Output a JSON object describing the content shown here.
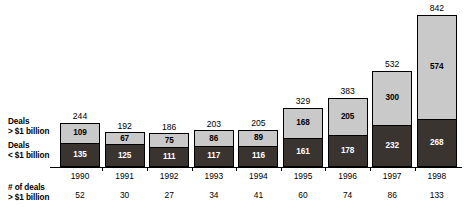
{
  "legend": {
    "above": {
      "line1": "Deals",
      "line2": "> $1 billion"
    },
    "below": {
      "line1": "Deals",
      "line2": "< $1 billion"
    }
  },
  "footer": {
    "line1": "# of deals",
    "line2": "> $1 billion"
  },
  "colors": {
    "segment_above_fill": "#c9c9c9",
    "segment_below_fill": "#3a3431",
    "outline": "#000000",
    "background": "#ffffff"
  },
  "chart_data": {
    "type": "bar",
    "title": "",
    "subtitle": "",
    "xlabel": "",
    "ylabel": "",
    "stacked": true,
    "grid": false,
    "legend_position": "left",
    "ylim": [
      0,
      842
    ],
    "categories": [
      "1990",
      "1991",
      "1992",
      "1993",
      "1994",
      "1995",
      "1996",
      "1997",
      "1998"
    ],
    "series": [
      {
        "name": "Deals < $1 billion",
        "values": [
          135,
          125,
          111,
          117,
          116,
          161,
          178,
          232,
          268
        ]
      },
      {
        "name": "Deals > $1 billion",
        "values": [
          109,
          67,
          75,
          86,
          89,
          168,
          205,
          300,
          574
        ]
      }
    ],
    "totals": [
      244,
      192,
      186,
      203,
      205,
      329,
      383,
      532,
      842
    ],
    "deal_counts": {
      "label": "# of deals > $1 billion",
      "values": [
        52,
        30,
        27,
        34,
        41,
        60,
        74,
        86,
        133
      ]
    }
  }
}
